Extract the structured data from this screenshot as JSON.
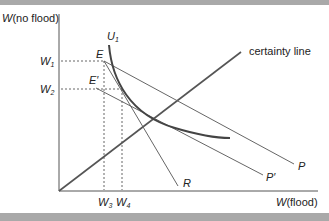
{
  "diagram": {
    "y_axis_label": {
      "var": "W",
      "rest": "(no flood)"
    },
    "x_axis_label": {
      "var": "W",
      "rest": "(flood)"
    },
    "y_ticks": [
      {
        "var": "W",
        "sub": "1"
      },
      {
        "var": "W",
        "sub": "2"
      }
    ],
    "x_ticks": [
      {
        "var": "W",
        "sub": "3"
      },
      {
        "var": "W",
        "sub": "4"
      }
    ],
    "points": {
      "E": "E",
      "E_prime": "E′"
    },
    "curve_label": {
      "var": "U",
      "sub": "1"
    },
    "line_labels": {
      "certainty": "certainty line",
      "P": "P",
      "P_prime": "P′",
      "R": "R"
    },
    "colors": {
      "axes": "#555555",
      "lines": "#555555",
      "curve": "#444444",
      "band": "#a9a9a9"
    }
  }
}
